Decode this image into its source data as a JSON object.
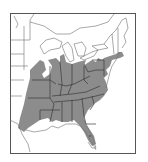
{
  "map": {
    "type": "range-map",
    "region": "Eastern United States",
    "colors": {
      "background": "#ffffff",
      "range_fill": "#8c8c8c",
      "state_border": "#3a3a3a",
      "outline": "#6e6e6e",
      "frame": "#555555"
    },
    "frame": {
      "x": 10,
      "y": 13,
      "width": 125,
      "height": 140
    },
    "shaded_states": [
      "Texas (east)",
      "Oklahoma (east)",
      "Kansas (east)",
      "Missouri",
      "Arkansas",
      "Louisiana",
      "Iowa (south)",
      "Illinois",
      "Indiana",
      "Ohio",
      "Kentucky",
      "Tennessee",
      "Mississippi",
      "Alabama",
      "Georgia",
      "Florida (panhandle/north)",
      "South Carolina",
      "North Carolina",
      "Virginia",
      "West Virginia",
      "Maryland",
      "Delaware",
      "Pennsylvania",
      "New Jersey",
      "New York (south)",
      "Connecticut",
      "Rhode Island",
      "Massachusetts (south)",
      "Michigan (south)",
      "Wisconsin (south)"
    ]
  }
}
